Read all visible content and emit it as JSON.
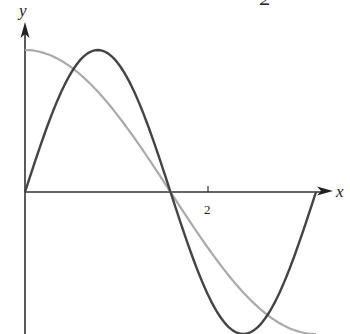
{
  "chart_data": {
    "type": "line",
    "title": "",
    "xlabel": "x",
    "ylabel": "y",
    "x_ticks": [
      {
        "value": 2,
        "label": "2"
      }
    ],
    "xlim": [
      0,
      3.1416
    ],
    "ylim": [
      -1,
      1
    ],
    "grid": false,
    "legend": "none",
    "series": [
      {
        "name": "dark curve (sin 2x)",
        "color": "#444444",
        "x": [
          0,
          0.3927,
          0.7854,
          1.1781,
          1.5708,
          1.9635,
          2.3562,
          2.7489,
          3.1416
        ],
        "y": [
          0,
          0.707,
          1,
          0.707,
          0,
          -0.707,
          -1,
          -0.707,
          0
        ]
      },
      {
        "name": "light curve (cos x)",
        "color": "#aaaaaa",
        "x": [
          0,
          0.3927,
          0.7854,
          1.1781,
          1.5708,
          1.9635,
          2.3562,
          2.7489,
          3.1416
        ],
        "y": [
          1,
          0.924,
          0.707,
          0.383,
          0,
          -0.383,
          -0.707,
          -0.924,
          -1
        ]
      }
    ],
    "annotations": [
      "2"
    ]
  },
  "labels": {
    "x_axis": "x",
    "y_axis": "y",
    "tick_2": "2",
    "top_fragment": "2"
  }
}
